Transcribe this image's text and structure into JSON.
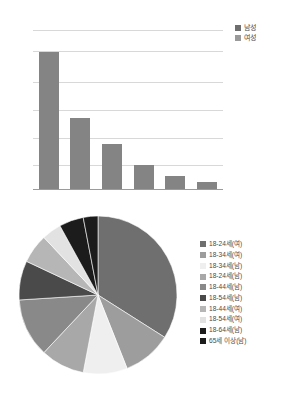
{
  "chart_data": [
    {
      "type": "bar",
      "title": "",
      "xlabel": "",
      "ylabel": "",
      "categories": [
        "1",
        "2",
        "3",
        "4",
        "5",
        "6"
      ],
      "values": [
        85,
        44,
        28,
        15,
        8,
        4
      ],
      "ylim": [
        0,
        100
      ],
      "grid": true,
      "gridline_values": [
        100,
        85,
        68,
        51,
        34,
        17
      ],
      "legend_position": "right",
      "series": [
        {
          "name": "남성",
          "color": "#6e6e6e"
        },
        {
          "name": "여성",
          "color": "#9a9a9a"
        }
      ],
      "bar_color": "#848484",
      "legend": [
        {
          "label": "남성",
          "color": "#6e6e6e"
        },
        {
          "label": "여성",
          "color": "#9a9a9a"
        }
      ]
    },
    {
      "type": "pie",
      "title": "",
      "legend_position": "right",
      "start_angle_deg": -90,
      "direction": "clockwise",
      "labels": [
        "18-24세(여)",
        "18-34세(여)",
        "18-34세(남)",
        "18-24세(남)",
        "18-44세(남)",
        "18-54세(남)",
        "18-44세(여)",
        "18-54세(여)",
        "18-64세(남)",
        "65세 이상(남)"
      ],
      "values": [
        34,
        10,
        9,
        9,
        12,
        8,
        6,
        4,
        5,
        3
      ],
      "colors": [
        "#6f6f6f",
        "#9d9d9d",
        "#efefef",
        "#a8a8a8",
        "#898989",
        "#4a4a4a",
        "#b6b6b6",
        "#e2e2e2",
        "#1c1c1c",
        "#1c1c1c"
      ],
      "legend": [
        {
          "label": "18-24세(여)",
          "color": "#6f6f6f"
        },
        {
          "label": "18-34세(여)",
          "color": "#9d9d9d"
        },
        {
          "label": "18-34세(남)",
          "color": "#efefef"
        },
        {
          "label": "18-24세(남)",
          "color": "#a8a8a8"
        },
        {
          "label": "18-44세(남)",
          "color": "#898989"
        },
        {
          "label": "18-54세(남)",
          "color": "#4a4a4a"
        },
        {
          "label": "18-44세(여)",
          "color": "#b6b6b6"
        },
        {
          "label": "18-54세(여)",
          "color": "#e2e2e2"
        },
        {
          "label": "18-64세(남)",
          "color": "#1c1c1c"
        },
        {
          "label": "65세 이상(남)",
          "color": "#1c1c1c"
        }
      ]
    }
  ]
}
